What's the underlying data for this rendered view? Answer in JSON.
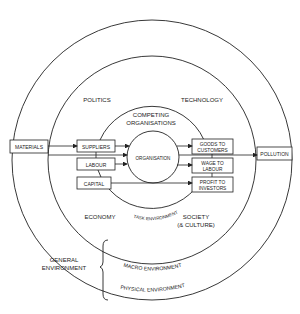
{
  "diagram": {
    "rings": {
      "general_environment": "GENERAL\nENVIRONMENT",
      "macro_environment": "MACRO ENVIRONMENT",
      "physical_environment": "PHYSICAL ENVIRONMENT",
      "task_environment": "TASK ENVIRONMENT",
      "competing_organisations": [
        "COMPETING",
        "ORGANISATIONS"
      ]
    },
    "macro_factors": {
      "politics": "POLITICS",
      "technology": "TECHNOLOGY",
      "economy": "ECONOMY",
      "society": [
        "SOCIETY",
        "(& CULTURE)"
      ]
    },
    "center": {
      "label": "ORGANISATION"
    },
    "inputs": {
      "materials": "MATERIALS",
      "suppliers": "SUPPLIERS",
      "labour": "LABOUR",
      "capital": "CAPITAL"
    },
    "outputs": {
      "goods": [
        "GOODS TO",
        "CUSTOMERS"
      ],
      "wage": [
        "WAGE TO",
        "LABOUR"
      ],
      "profit": [
        "PROFIT TO",
        "INVESTORS"
      ],
      "pollution": "POLLUTION"
    },
    "general_env_lines": [
      "GENERAL",
      "ENVIRONMENT"
    ]
  },
  "colors": {
    "stroke": "#222222",
    "background": "#ffffff"
  }
}
